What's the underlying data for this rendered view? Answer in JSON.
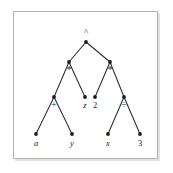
{
  "figure": {
    "kind": "expression-tree",
    "caption": "",
    "frame": {
      "border_color": "#b2b2b2",
      "shadow_color": "#e2e2e2",
      "background": "#ffffff"
    },
    "ink_color": "#1c1c1c",
    "edge_color": "#2b2b2b"
  },
  "chart_data": {
    "type": "diagram",
    "title": "",
    "xlabel": "",
    "ylabel": "",
    "grid": false,
    "legend": "none",
    "nodes": [
      {
        "id": "n0",
        "label": "^",
        "kind": "operator",
        "style": "upright",
        "level": 0,
        "x": 86,
        "y": 42,
        "label_x": 86,
        "label_y": 33
      },
      {
        "id": "n1",
        "label": "*",
        "kind": "operator",
        "style": "upright",
        "level": 1,
        "x": 69,
        "y": 62,
        "label_x": 69,
        "label_y": 71
      },
      {
        "id": "n2",
        "label": "*",
        "kind": "operator",
        "style": "upright",
        "level": 1,
        "x": 110,
        "y": 62,
        "label_x": 110,
        "label_y": 71
      },
      {
        "id": "n3",
        "label": "+",
        "kind": "operator",
        "style": "upright",
        "level": 2,
        "x": 54,
        "y": 97,
        "label_x": 54,
        "label_y": 106
      },
      {
        "id": "n4",
        "label": "z",
        "kind": "variable",
        "style": "italic",
        "level": 2,
        "x": 85,
        "y": 97,
        "label_x": 85,
        "label_y": 106
      },
      {
        "id": "n5",
        "label": "2",
        "kind": "number",
        "style": "upright",
        "level": 2,
        "x": 95,
        "y": 97,
        "label_x": 95,
        "label_y": 106
      },
      {
        "id": "n6",
        "label": "÷",
        "kind": "operator",
        "style": "upright",
        "level": 2,
        "x": 124,
        "y": 97,
        "label_x": 124,
        "label_y": 106
      },
      {
        "id": "n7",
        "label": "a",
        "kind": "variable",
        "style": "italic",
        "level": 3,
        "x": 36,
        "y": 134,
        "label_x": 36,
        "label_y": 144
      },
      {
        "id": "n8",
        "label": "y",
        "kind": "variable",
        "style": "italic",
        "level": 3,
        "x": 72,
        "y": 134,
        "label_x": 72,
        "label_y": 144
      },
      {
        "id": "n9",
        "label": "x",
        "kind": "variable",
        "style": "italic",
        "level": 3,
        "x": 108,
        "y": 134,
        "label_x": 108,
        "label_y": 144
      },
      {
        "id": "n10",
        "label": "3",
        "kind": "number",
        "style": "upright",
        "level": 3,
        "x": 140,
        "y": 134,
        "label_x": 140,
        "label_y": 144
      }
    ],
    "edges": [
      {
        "from": "n0",
        "to": "n1"
      },
      {
        "from": "n0",
        "to": "n2"
      },
      {
        "from": "n1",
        "to": "n3"
      },
      {
        "from": "n1",
        "to": "n4"
      },
      {
        "from": "n2",
        "to": "n5"
      },
      {
        "from": "n2",
        "to": "n6"
      },
      {
        "from": "n3",
        "to": "n7"
      },
      {
        "from": "n3",
        "to": "n8"
      },
      {
        "from": "n6",
        "to": "n9"
      },
      {
        "from": "n6",
        "to": "n10"
      }
    ],
    "node_radius": 1.9
  }
}
